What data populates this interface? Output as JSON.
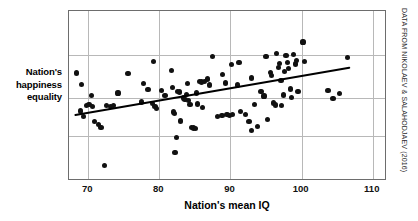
{
  "chart_data": {
    "type": "scatter",
    "title": "",
    "xlabel": "Nation's mean IQ",
    "ylabel": "Nation's happiness equality",
    "ylabel_lines": [
      "Nation's",
      "happiness",
      "equality"
    ],
    "xlim": [
      67.3,
      112.0
    ],
    "ylim": [
      0,
      100
    ],
    "xticks": [
      70,
      80,
      90,
      100,
      110
    ],
    "xticklabels": [
      "70",
      "80",
      "90",
      "100",
      "110"
    ],
    "yticks": [],
    "yticklabels": [],
    "grid": {
      "x": true,
      "y": true,
      "color": "#b8b8b8"
    },
    "gridlines_y_frac": [
      0.26,
      0.51,
      0.735
    ],
    "legend": null,
    "point_color": "#111111",
    "trendline": {
      "show": true,
      "color": "#000000",
      "x": [
        68.2,
        106.7
      ],
      "y": [
        38.8,
        66.6
      ]
    },
    "annotations": [
      {
        "text": "DATA FROM NIKOLAEV & SALAHODJAEV (2016)",
        "position": "right-rotated"
      }
    ],
    "points": [
      {
        "x": 68.3,
        "y": 63.5
      },
      {
        "x": 69.1,
        "y": 57.0
      },
      {
        "x": 68.9,
        "y": 41.2
      },
      {
        "x": 69.3,
        "y": 38.0
      },
      {
        "x": 69.8,
        "y": 44.4
      },
      {
        "x": 70.1,
        "y": 44.9
      },
      {
        "x": 70.5,
        "y": 50.4
      },
      {
        "x": 70.6,
        "y": 44.0
      },
      {
        "x": 70.9,
        "y": 34.8
      },
      {
        "x": 71.5,
        "y": 33.2
      },
      {
        "x": 71.8,
        "y": 31.3
      },
      {
        "x": 72.3,
        "y": 9.0
      },
      {
        "x": 72.6,
        "y": 44.5
      },
      {
        "x": 73.1,
        "y": 43.8
      },
      {
        "x": 73.5,
        "y": 44.2
      },
      {
        "x": 74.2,
        "y": 51.8
      },
      {
        "x": 75.6,
        "y": 63.2
      },
      {
        "x": 77.5,
        "y": 46.5
      },
      {
        "x": 77.8,
        "y": 57.3
      },
      {
        "x": 78.4,
        "y": 54.0
      },
      {
        "x": 79.0,
        "y": 45.5
      },
      {
        "x": 79.2,
        "y": 70.5
      },
      {
        "x": 79.4,
        "y": 44.0
      },
      {
        "x": 79.6,
        "y": 42.5
      },
      {
        "x": 80.3,
        "y": 53.2
      },
      {
        "x": 80.8,
        "y": 50.1
      },
      {
        "x": 81.7,
        "y": 65.0
      },
      {
        "x": 81.9,
        "y": 54.9
      },
      {
        "x": 82.0,
        "y": 40.6
      },
      {
        "x": 82.1,
        "y": 39.9
      },
      {
        "x": 82.2,
        "y": 17.0
      },
      {
        "x": 82.4,
        "y": 25.4
      },
      {
        "x": 82.6,
        "y": 52.8
      },
      {
        "x": 82.8,
        "y": 52.3
      },
      {
        "x": 83.0,
        "y": 35.3
      },
      {
        "x": 83.4,
        "y": 48.8
      },
      {
        "x": 83.6,
        "y": 48.1
      },
      {
        "x": 83.8,
        "y": 50.8
      },
      {
        "x": 83.9,
        "y": 57.3
      },
      {
        "x": 84.1,
        "y": 47.2
      },
      {
        "x": 84.3,
        "y": 44.8
      },
      {
        "x": 84.5,
        "y": 31.6
      },
      {
        "x": 84.8,
        "y": 31.2
      },
      {
        "x": 85.1,
        "y": 31.0
      },
      {
        "x": 85.2,
        "y": 51.8
      },
      {
        "x": 85.4,
        "y": 45.3
      },
      {
        "x": 85.7,
        "y": 58.6
      },
      {
        "x": 85.9,
        "y": 58.2
      },
      {
        "x": 86.1,
        "y": 43.3
      },
      {
        "x": 86.4,
        "y": 58.4
      },
      {
        "x": 86.8,
        "y": 60.0
      },
      {
        "x": 87.0,
        "y": 56.5
      },
      {
        "x": 87.5,
        "y": 73.4
      },
      {
        "x": 88.2,
        "y": 38.0
      },
      {
        "x": 88.8,
        "y": 38.3
      },
      {
        "x": 88.9,
        "y": 62.8
      },
      {
        "x": 89.3,
        "y": 57.6
      },
      {
        "x": 89.5,
        "y": 39.0
      },
      {
        "x": 89.9,
        "y": 38.7
      },
      {
        "x": 90.1,
        "y": 68.3
      },
      {
        "x": 90.3,
        "y": 39.0
      },
      {
        "x": 91.0,
        "y": 56.5
      },
      {
        "x": 91.2,
        "y": 69.8
      },
      {
        "x": 91.4,
        "y": 41.0
      },
      {
        "x": 92.1,
        "y": 39.0
      },
      {
        "x": 92.6,
        "y": 35.0
      },
      {
        "x": 92.9,
        "y": 29.7
      },
      {
        "x": 93.0,
        "y": 60.6
      },
      {
        "x": 93.4,
        "y": 45.0
      },
      {
        "x": 93.8,
        "y": 32.1
      },
      {
        "x": 94.3,
        "y": 52.8
      },
      {
        "x": 94.7,
        "y": 50.0
      },
      {
        "x": 95.0,
        "y": 73.3
      },
      {
        "x": 95.2,
        "y": 36.1
      },
      {
        "x": 95.6,
        "y": 63.9
      },
      {
        "x": 95.8,
        "y": 62.2
      },
      {
        "x": 96.0,
        "y": 45.9
      },
      {
        "x": 96.3,
        "y": 44.7
      },
      {
        "x": 96.5,
        "y": 75.2
      },
      {
        "x": 96.8,
        "y": 66.7
      },
      {
        "x": 96.9,
        "y": 69.1
      },
      {
        "x": 97.1,
        "y": 59.3
      },
      {
        "x": 97.2,
        "y": 44.2
      },
      {
        "x": 97.4,
        "y": 50.6
      },
      {
        "x": 97.6,
        "y": 64.4
      },
      {
        "x": 97.8,
        "y": 73.8
      },
      {
        "x": 98.0,
        "y": 69.9
      },
      {
        "x": 98.2,
        "y": 66.0
      },
      {
        "x": 98.4,
        "y": 54.1
      },
      {
        "x": 98.6,
        "y": 48.9
      },
      {
        "x": 98.8,
        "y": 74.2
      },
      {
        "x": 99.1,
        "y": 68.8
      },
      {
        "x": 99.3,
        "y": 71.0
      },
      {
        "x": 99.5,
        "y": 52.8
      },
      {
        "x": 100.2,
        "y": 81.8
      },
      {
        "x": 100.4,
        "y": 70.3
      },
      {
        "x": 103.7,
        "y": 53.4
      },
      {
        "x": 104.4,
        "y": 48.5
      },
      {
        "x": 105.3,
        "y": 51.3
      },
      {
        "x": 106.5,
        "y": 72.5
      }
    ]
  },
  "credit": {
    "text": "DATA FROM NIKOLAEV & SALAHODJAEV (2016)"
  }
}
